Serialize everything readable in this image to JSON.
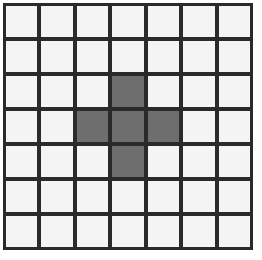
{
  "grid": {
    "rows": 7,
    "cols": 7,
    "line_color": "#2a2a2a",
    "empty_color": "#f4f4f4",
    "filled_color": "#6e6e6e",
    "filled_cells": [
      [
        2,
        3
      ],
      [
        3,
        2
      ],
      [
        3,
        3
      ],
      [
        3,
        4
      ],
      [
        4,
        3
      ]
    ]
  }
}
